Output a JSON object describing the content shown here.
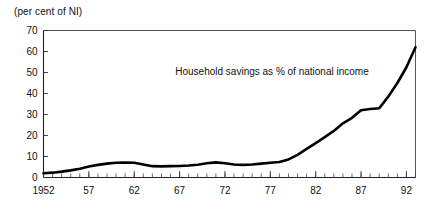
{
  "unit_label": "(per cent of NI)",
  "annotation": "Household savings as % of national income",
  "colors": {
    "line": "#000000",
    "frame": "#555555",
    "text": "#111111"
  },
  "chart_data": {
    "type": "line",
    "title": "",
    "subtitle": "",
    "xlabel": "",
    "ylabel": "(per cent of NI)",
    "annotations": [
      "Household savings as % of national income"
    ],
    "grid": false,
    "legend": "none",
    "xlim": [
      1952,
      1993
    ],
    "ylim": [
      0,
      70
    ],
    "ytick_labels": [
      "0",
      "10",
      "20",
      "30",
      "40",
      "50",
      "60",
      "70"
    ],
    "yticks": [
      0,
      10,
      20,
      30,
      40,
      50,
      60,
      70
    ],
    "xtick_labels": [
      "1952",
      "57",
      "62",
      "67",
      "72",
      "77",
      "82",
      "87",
      "92"
    ],
    "xticks": [
      1952,
      1957,
      1962,
      1967,
      1972,
      1977,
      1982,
      1987,
      1992
    ],
    "x_minor_tick_interval": 1,
    "series": [
      {
        "name": "Household savings as % of national income",
        "x": [
          1952,
          1953,
          1954,
          1955,
          1956,
          1957,
          1958,
          1959,
          1960,
          1961,
          1962,
          1963,
          1964,
          1965,
          1966,
          1967,
          1968,
          1969,
          1970,
          1971,
          1972,
          1973,
          1974,
          1975,
          1976,
          1977,
          1978,
          1979,
          1980,
          1981,
          1982,
          1983,
          1984,
          1985,
          1986,
          1987,
          1988,
          1989,
          1990,
          1991,
          1992,
          1993
        ],
        "values": [
          2.0,
          2.3,
          2.8,
          3.4,
          4.2,
          5.2,
          6.0,
          6.6,
          7.0,
          7.1,
          7.0,
          6.2,
          5.4,
          5.3,
          5.4,
          5.5,
          5.7,
          6.1,
          6.8,
          7.2,
          6.8,
          6.2,
          6.0,
          6.2,
          6.6,
          7.0,
          7.4,
          8.6,
          10.8,
          13.6,
          16.4,
          19.2,
          22.2,
          25.8,
          28.4,
          32.0,
          32.6,
          33.0,
          38.5,
          45.0,
          52.5,
          62.0
        ]
      }
    ]
  }
}
